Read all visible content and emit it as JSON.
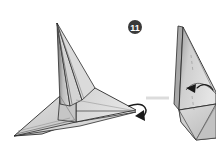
{
  "page": {
    "width": 216,
    "height": 146,
    "background_color": "#ffffff",
    "kind": "origami-instruction-step"
  },
  "step_badge": {
    "label": "11",
    "shape": "filled-circle",
    "circle_color": "#3a3a3a",
    "text_color": "#ffffff",
    "center_x": 135,
    "center_y": 27,
    "radius": 7
  },
  "figures": {
    "before": {
      "name": "origami-model-before",
      "description": "three-dimensional folded paper model with tall vertical spike and wide flat base pointing right",
      "fill_light": "#e3e3e3",
      "fill_mid": "#c9c9c9",
      "fill_dark": "#b0b0b0",
      "fill_darkest": "#8e8e8e",
      "stroke_color": "#2b2b2b"
    },
    "after": {
      "name": "origami-model-after",
      "description": "resulting folded paper model standing upright after the fold, partially cropped at right edge",
      "fill_light": "#e3e3e3",
      "fill_mid": "#cccccc",
      "fill_dark": "#b4b4b4",
      "stroke_color": "#2b2b2b"
    }
  },
  "annotations": {
    "fold_arrow": {
      "name": "curved-fold-arrow",
      "type": "curved-arrow",
      "color": "#1a1a1a",
      "description": "curved arrow wrapping around the right tip of the model indicating the fold direction"
    },
    "inner_arrow": {
      "name": "inner-fold-arrow",
      "type": "solid-triangle-arrow",
      "color": "#1a1a1a",
      "description": "small solid arrowhead inside the resulting model pointing left"
    },
    "separator_line": {
      "name": "separator-line",
      "color": "#dcdcdc",
      "description": "faint light gray horizontal rule between the two figures"
    }
  }
}
